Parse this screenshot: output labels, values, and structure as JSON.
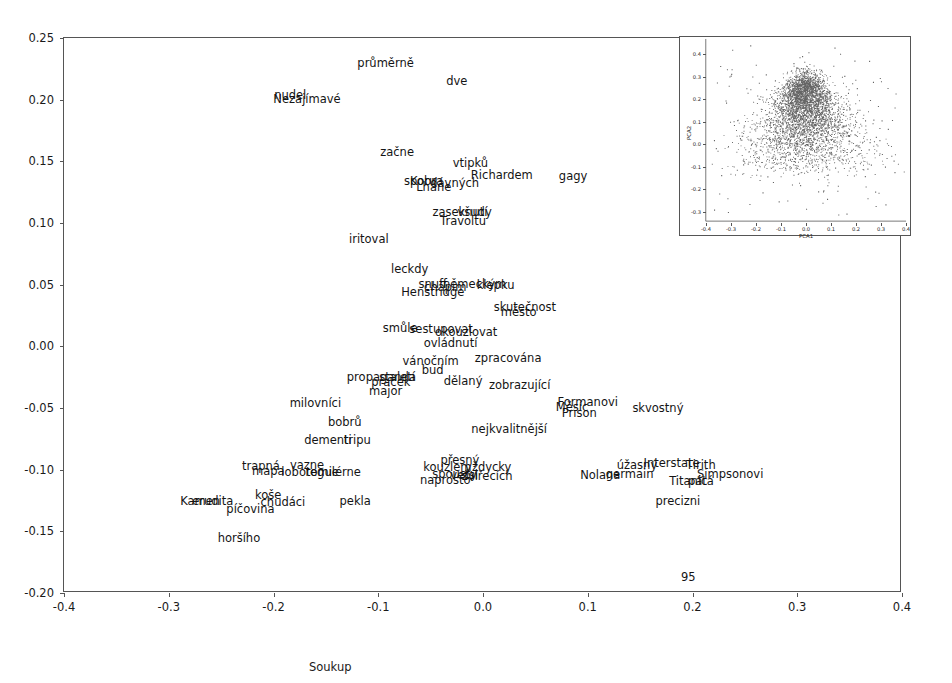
{
  "chart_data": {
    "type": "scatter",
    "title": "",
    "xlabel": "Soukup",
    "ylabel": "",
    "xlim": [
      -0.4,
      0.4
    ],
    "ylim": [
      -0.2,
      0.25
    ],
    "grid": false,
    "legend": "none",
    "xticks": [
      "-0.4",
      "-0.3",
      "-0.2",
      "-0.1",
      "0.0",
      "0.1",
      "0.2",
      "0.3",
      "0.4"
    ],
    "xtick_values": [
      -0.4,
      -0.3,
      -0.2,
      -0.1,
      0.0,
      0.1,
      0.2,
      0.3,
      0.4
    ],
    "yticks": [
      "-0.20",
      "-0.15",
      "-0.10",
      "-0.05",
      "0.00",
      "0.05",
      "0.10",
      "0.15",
      "0.20",
      "0.25"
    ],
    "ytick_values": [
      -0.2,
      -0.15,
      -0.1,
      -0.05,
      0.0,
      0.05,
      0.1,
      0.15,
      0.2,
      0.25
    ],
    "point_labels": [
      {
        "text": "průměrně",
        "x": -0.093,
        "y": 0.229
      },
      {
        "text": "dve",
        "x": -0.025,
        "y": 0.214
      },
      {
        "text": "nudel",
        "x": -0.184,
        "y": 0.203
      },
      {
        "text": "Nezajímavé",
        "x": -0.168,
        "y": 0.2
      },
      {
        "text": "začne",
        "x": -0.082,
        "y": 0.157
      },
      {
        "text": "vtipků",
        "x": -0.012,
        "y": 0.148
      },
      {
        "text": "Richardem",
        "x": 0.018,
        "y": 0.138
      },
      {
        "text": "gagy",
        "x": 0.086,
        "y": 0.137
      },
      {
        "text": "sporu",
        "x": -0.06,
        "y": 0.133
      },
      {
        "text": "Kobra",
        "x": -0.054,
        "y": 0.133
      },
      {
        "text": "dávných",
        "x": -0.027,
        "y": 0.132
      },
      {
        "text": "Lhane",
        "x": -0.047,
        "y": 0.128
      },
      {
        "text": "zaseknutí",
        "x": -0.022,
        "y": 0.108
      },
      {
        "text": "všudy",
        "x": -0.008,
        "y": 0.108
      },
      {
        "text": "Travoltu",
        "x": -0.019,
        "y": 0.101
      },
      {
        "text": "iritoval",
        "x": -0.109,
        "y": 0.086
      },
      {
        "text": "leckdy",
        "x": -0.07,
        "y": 0.062
      },
      {
        "text": "snuff",
        "x": -0.048,
        "y": 0.05
      },
      {
        "text": "chápím",
        "x": -0.036,
        "y": 0.047
      },
      {
        "text": "německým",
        "x": -0.008,
        "y": 0.05
      },
      {
        "text": "klepku",
        "x": 0.012,
        "y": 0.049
      },
      {
        "text": "Henstridge",
        "x": -0.048,
        "y": 0.043
      },
      {
        "text": "skutečnost",
        "x": 0.04,
        "y": 0.031
      },
      {
        "text": "město",
        "x": 0.034,
        "y": 0.027
      },
      {
        "text": "smůle",
        "x": -0.079,
        "y": 0.014
      },
      {
        "text": "sestupovat",
        "x": -0.04,
        "y": 0.013
      },
      {
        "text": "okouzlovat",
        "x": -0.016,
        "y": 0.011
      },
      {
        "text": "ovládnutí",
        "x": -0.031,
        "y": 0.002
      },
      {
        "text": "zpracována",
        "x": 0.024,
        "y": -0.01
      },
      {
        "text": "vánočním",
        "x": -0.05,
        "y": -0.013
      },
      {
        "text": "bud",
        "x": -0.048,
        "y": -0.02
      },
      {
        "text": "propaganda",
        "x": -0.097,
        "y": -0.026
      },
      {
        "text": "staletí",
        "x": -0.082,
        "y": -0.026
      },
      {
        "text": "pracek",
        "x": -0.088,
        "y": -0.03
      },
      {
        "text": "dělaný",
        "x": -0.019,
        "y": -0.029
      },
      {
        "text": "zobrazující",
        "x": 0.035,
        "y": -0.032
      },
      {
        "text": "major",
        "x": -0.093,
        "y": -0.037
      },
      {
        "text": "milovníci",
        "x": -0.16,
        "y": -0.047
      },
      {
        "text": "Formanovi",
        "x": 0.1,
        "y": -0.046
      },
      {
        "text": "Měsíc",
        "x": 0.085,
        "y": -0.05
      },
      {
        "text": "skvostný",
        "x": 0.167,
        "y": -0.051
      },
      {
        "text": "Prison",
        "x": 0.092,
        "y": -0.055
      },
      {
        "text": "bobrů",
        "x": -0.132,
        "y": -0.062
      },
      {
        "text": "nejkvalitnější",
        "x": 0.025,
        "y": -0.068
      },
      {
        "text": "dementi",
        "x": -0.148,
        "y": -0.077
      },
      {
        "text": "tripu",
        "x": -0.12,
        "y": -0.077
      },
      {
        "text": "přesný",
        "x": -0.022,
        "y": -0.093
      },
      {
        "text": "úžasný",
        "x": 0.147,
        "y": -0.097
      },
      {
        "text": "Interstate",
        "x": 0.18,
        "y": -0.095
      },
      {
        "text": "Tirith",
        "x": 0.208,
        "y": -0.097
      },
      {
        "text": "trapná",
        "x": -0.212,
        "y": -0.098
      },
      {
        "text": "vazne",
        "x": -0.168,
        "y": -0.097
      },
      {
        "text": "kouzlem",
        "x": -0.034,
        "y": -0.099
      },
      {
        "text": "vždycky",
        "x": 0.005,
        "y": -0.099
      },
      {
        "text": "Simpsonovi",
        "x": 0.236,
        "y": -0.104
      },
      {
        "text": "Nolana",
        "x": 0.112,
        "y": -0.105
      },
      {
        "text": "germain",
        "x": 0.14,
        "y": -0.104
      },
      {
        "text": "mapa",
        "x": -0.205,
        "y": -0.102
      },
      {
        "text": "lobotomie",
        "x": -0.165,
        "y": -0.103
      },
      {
        "text": "regulérne",
        "x": -0.143,
        "y": -0.103
      },
      {
        "text": "spousty",
        "x": -0.027,
        "y": -0.104
      },
      {
        "text": "vetsi",
        "x": -0.018,
        "y": -0.105
      },
      {
        "text": "zvířecích",
        "x": 0.004,
        "y": -0.106
      },
      {
        "text": "naprosto",
        "x": -0.036,
        "y": -0.109
      },
      {
        "text": "Titanic",
        "x": 0.196,
        "y": -0.11
      },
      {
        "text": "pátá",
        "x": 0.208,
        "y": -0.11
      },
      {
        "text": "koše",
        "x": -0.205,
        "y": -0.121
      },
      {
        "text": "Kamen",
        "x": -0.27,
        "y": -0.126
      },
      {
        "text": "erudita",
        "x": -0.258,
        "y": -0.126
      },
      {
        "text": "chudáci",
        "x": -0.191,
        "y": -0.127
      },
      {
        "text": "pekla",
        "x": -0.122,
        "y": -0.126
      },
      {
        "text": "precizni",
        "x": 0.186,
        "y": -0.126
      },
      {
        "text": "píčovina",
        "x": -0.222,
        "y": -0.133
      },
      {
        "text": "horšího",
        "x": -0.233,
        "y": -0.156
      },
      {
        "text": "95",
        "x": 0.196,
        "y": -0.188
      }
    ]
  },
  "inset": {
    "type": "scatter",
    "xlabel": "PCA1",
    "ylabel": "PCA2",
    "xlim": [
      -0.4,
      0.4
    ],
    "ylim": [
      -0.35,
      0.45
    ],
    "xticks": [
      "-0.4",
      "-0.3",
      "-0.2",
      "-0.1",
      "0.0",
      "0.1",
      "0.2",
      "0.3",
      "0.4"
    ],
    "xtick_values": [
      -0.4,
      -0.3,
      -0.2,
      -0.1,
      0.0,
      0.1,
      0.2,
      0.3,
      0.4
    ],
    "yticks": [
      "-0.3",
      "-0.2",
      "-0.1",
      "0.0",
      "0.1",
      "0.2",
      "0.3",
      "0.4"
    ],
    "ytick_values": [
      -0.3,
      -0.2,
      -0.1,
      0.0,
      0.1,
      0.2,
      0.3,
      0.4
    ],
    "point_color": "#4a4a4a",
    "n_points": 4200
  }
}
